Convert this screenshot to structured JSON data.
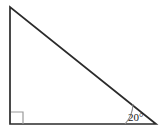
{
  "figure": {
    "name": "right-triangle-with-20-degree-angle",
    "background_color": "#ffffff",
    "width": 162,
    "height": 132,
    "stroke_color": "#2b2b2b",
    "marker_color": "#9a9a9a",
    "arc_color": "#8c8c8c",
    "label_color": "#1a1a1a"
  },
  "geometry": {
    "vertices": {
      "apex": {
        "label": "apex",
        "x": 10,
        "y": 7
      },
      "right_angle": {
        "label": "right-angle-vertex",
        "x": 10,
        "y": 124
      },
      "base_right": {
        "label": "base-right-vertex",
        "x": 156,
        "y": 124
      }
    },
    "edges": [
      {
        "name": "vertical-leg",
        "from": "apex",
        "to": "right_angle"
      },
      {
        "name": "horizontal-leg",
        "from": "right_angle",
        "to": "base_right"
      },
      {
        "name": "hypotenuse",
        "from": "apex",
        "to": "base_right"
      }
    ],
    "right_angle_marker": {
      "x": 11,
      "y": 112,
      "size": 12
    },
    "angle_arc": {
      "center_x": 156,
      "center_y": 124,
      "radius": 31
    }
  },
  "labels": {
    "angle_value": "20",
    "degree_symbol": "°",
    "angle_text": "20°",
    "angle_label_x": 128,
    "angle_label_y": 121
  },
  "paths": {
    "triangle": "M 10 7 L 10 124 L 156 124 Z",
    "right_angle_marker": "M 11 112 L 23 112 L 23 124",
    "angle_arc": "M 125 124 A 31 31 0 0 0 133.0 104.0"
  }
}
